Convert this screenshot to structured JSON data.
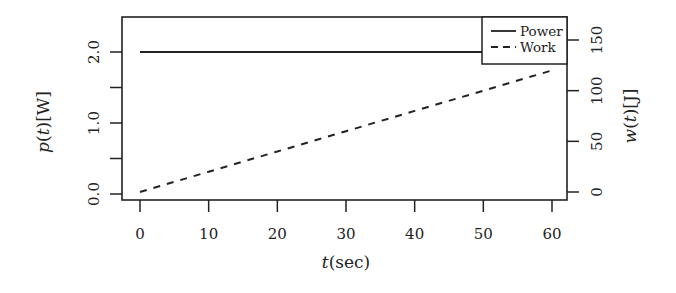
{
  "chart_data": {
    "type": "line",
    "title": "",
    "xlabel": "t(sec)",
    "ylabel": "p(t)[W]",
    "y2label": "w(t)[J]",
    "x": [
      0,
      10,
      20,
      30,
      40,
      50,
      60
    ],
    "xlim": [
      0,
      60
    ],
    "ylim": [
      0,
      2.0
    ],
    "y2lim": [
      0,
      150
    ],
    "xticks": [
      0,
      10,
      20,
      30,
      40,
      50,
      60
    ],
    "yticks": [
      0.0,
      0.5,
      1.0,
      1.5,
      2.0
    ],
    "ytick_labels": [
      "0.0",
      "",
      "1.0",
      "",
      "2.0"
    ],
    "y2ticks": [
      0,
      50,
      100,
      150
    ],
    "y2tick_labels": [
      "0",
      "50",
      "100",
      "150"
    ],
    "grid": false,
    "legend_position": "top-right",
    "series": [
      {
        "name": "Power",
        "axis": "left",
        "line_style": "solid",
        "color": "#222222",
        "values": [
          2.0,
          2.0,
          2.0,
          2.0,
          2.0,
          2.0,
          2.0
        ]
      },
      {
        "name": "Work",
        "axis": "right",
        "line_style": "dashed",
        "color": "#222222",
        "values": [
          0,
          20,
          40,
          60,
          80,
          100,
          120
        ]
      }
    ]
  },
  "labels": {
    "xlabel_t": "t",
    "xlabel_rest": "(sec)",
    "ylabel_p": "p",
    "ylabel_open": "(",
    "ylabel_t": "t",
    "ylabel_rest": ")[W]",
    "y2label_w": "w",
    "y2label_open": "(",
    "y2label_t": "t",
    "y2label_rest": ")[J]"
  },
  "legend": {
    "items": [
      {
        "label": "Power",
        "style": "solid"
      },
      {
        "label": "Work",
        "style": "dashed"
      }
    ]
  }
}
